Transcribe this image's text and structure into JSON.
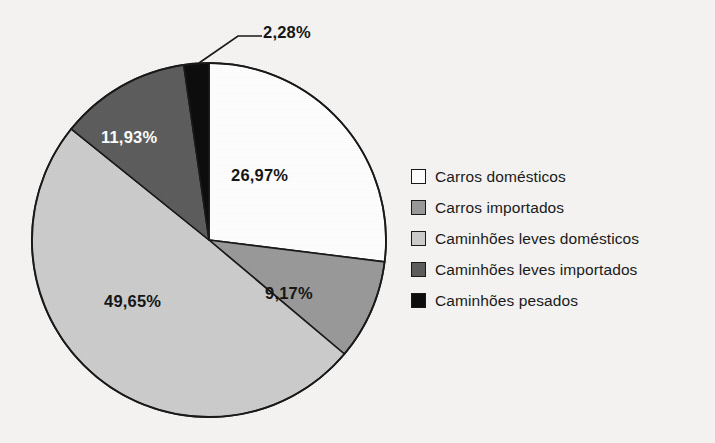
{
  "chart_data": {
    "type": "pie",
    "title": "",
    "subtitle": "",
    "xlabel": "",
    "ylabel": "",
    "units": "percent",
    "decimal_separator": ",",
    "legend_position": "right",
    "grid": false,
    "start_angle_deg": 0,
    "direction": "clockwise",
    "categories": [
      "Carros domésticos",
      "Carros importados",
      "Caminhões leves domésticos",
      "Caminhões leves importados",
      "Caminhões pesados"
    ],
    "values": [
      26.97,
      9.17,
      49.65,
      11.93,
      2.28
    ],
    "labels": [
      "26,97%",
      "9,17%",
      "49,65%",
      "11,93%",
      "2,28%"
    ],
    "colors": [
      "#ffffff",
      "#9a9a9a",
      "#cdcdcd",
      "#5e5e5e",
      "#0d0d0d"
    ],
    "slices": [
      {
        "name": "Carros domésticos",
        "value": 26.97,
        "label": "26,97%",
        "color": "#ffffff",
        "label_color": "dark",
        "start_deg": 0,
        "end_deg": 97.09,
        "callout": false
      },
      {
        "name": "Carros importados",
        "value": 9.17,
        "label": "9,17%",
        "color": "#9a9a9a",
        "label_color": "dark",
        "start_deg": 97.09,
        "end_deg": 130.1,
        "callout": false
      },
      {
        "name": "Caminhões leves domésticos",
        "value": 49.65,
        "label": "49,65%",
        "color": "#cdcdcd",
        "label_color": "dark",
        "start_deg": 130.1,
        "end_deg": 308.84,
        "callout": false
      },
      {
        "name": "Caminhões leves importados",
        "value": 11.93,
        "label": "11,93%",
        "color": "#5e5e5e",
        "label_color": "light",
        "start_deg": 308.84,
        "end_deg": 351.79,
        "callout": false
      },
      {
        "name": "Caminhões pesados",
        "value": 2.28,
        "label": "2,28%",
        "color": "#0d0d0d",
        "label_color": "dark",
        "start_deg": 351.79,
        "end_deg": 360,
        "callout": true
      }
    ]
  },
  "legend": {
    "items": [
      {
        "label": "Carros domésticos",
        "color": "#ffffff",
        "swatch_name": "legend-swatch-carros-domesticos"
      },
      {
        "label": "Carros importados",
        "color": "#9a9a9a",
        "swatch_name": "legend-swatch-carros-importados"
      },
      {
        "label": "Caminhões leves domésticos",
        "color": "#cdcdcd",
        "swatch_name": "legend-swatch-caminhoes-leves-domesticos"
      },
      {
        "label": "Caminhões leves importados",
        "color": "#5e5e5e",
        "swatch_name": "legend-swatch-caminhoes-leves-importados"
      },
      {
        "label": "Caminhões pesados",
        "color": "#0d0d0d",
        "swatch_name": "legend-swatch-caminhoes-pesados"
      }
    ]
  },
  "style": {
    "background": "#f6f5f3",
    "outline": "#1a1a1a",
    "text": "#1b1b1b",
    "label_on_dark": "#ffffff",
    "label_on_light": "#161616"
  }
}
